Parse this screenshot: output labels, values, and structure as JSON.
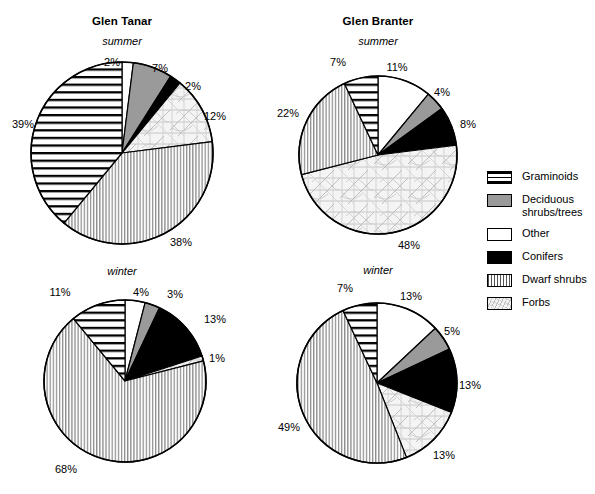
{
  "figure": {
    "panels": [
      {
        "site": "Glen Tanar",
        "season": "summer",
        "show_site_title": true,
        "cx": 122,
        "cy": 153,
        "r": 91,
        "labels": [
          {
            "text": "2%",
            "x": 112,
            "y": 62
          },
          {
            "text": "7%",
            "x": 160,
            "y": 68
          },
          {
            "text": "2%",
            "x": 193,
            "y": 86
          },
          {
            "text": "12%",
            "x": 215,
            "y": 116
          },
          {
            "text": "38%",
            "x": 181,
            "y": 242
          },
          {
            "text": "39%",
            "x": 23,
            "y": 124
          }
        ]
      },
      {
        "site": "Glen Branter",
        "season": "summer",
        "show_site_title": true,
        "cx": 378,
        "cy": 155,
        "r": 79,
        "labels": [
          {
            "text": "11%",
            "x": 397,
            "y": 67
          },
          {
            "text": "4%",
            "x": 442,
            "y": 92
          },
          {
            "text": "8%",
            "x": 468,
            "y": 124
          },
          {
            "text": "48%",
            "x": 409,
            "y": 245
          },
          {
            "text": "22%",
            "x": 288,
            "y": 113
          },
          {
            "text": "7%",
            "x": 338,
            "y": 62
          }
        ]
      },
      {
        "site": "Glen Tanar",
        "season": "winter",
        "show_site_title": false,
        "cx": 125,
        "cy": 381,
        "r": 81,
        "labels": [
          {
            "text": "4%",
            "x": 141,
            "y": 292
          },
          {
            "text": "3%",
            "x": 175,
            "y": 294
          },
          {
            "text": "13%",
            "x": 215,
            "y": 319
          },
          {
            "text": "1%",
            "x": 217,
            "y": 358
          },
          {
            "text": "68%",
            "x": 66,
            "y": 469
          },
          {
            "text": "11%",
            "x": 60,
            "y": 292
          }
        ]
      },
      {
        "site": "Glen Branter",
        "season": "winter",
        "show_site_title": false,
        "cx": 377,
        "cy": 383,
        "r": 80,
        "labels": [
          {
            "text": "13%",
            "x": 411,
            "y": 296
          },
          {
            "text": "5%",
            "x": 452,
            "y": 331
          },
          {
            "text": "13%",
            "x": 470,
            "y": 385
          },
          {
            "text": "13%",
            "x": 444,
            "y": 455
          },
          {
            "text": "49%",
            "x": 289,
            "y": 427
          },
          {
            "text": "7%",
            "x": 345,
            "y": 288
          }
        ]
      }
    ],
    "titles": [
      {
        "text": "Glen Tanar",
        "x": 122,
        "y": 22
      },
      {
        "text": "Glen Branter",
        "x": 378,
        "y": 22
      }
    ],
    "seasons": [
      {
        "text": "summer",
        "x": 122,
        "y": 42
      },
      {
        "text": "summer",
        "x": 378,
        "y": 42
      },
      {
        "text": "winter",
        "x": 122,
        "y": 272
      },
      {
        "text": "winter",
        "x": 378,
        "y": 271
      }
    ]
  },
  "legend": {
    "items": [
      {
        "label": "Graminoids",
        "pattern": "graminoids",
        "swatch_class": "sw-graminoids"
      },
      {
        "label": "Deciduous\nshrubs/trees",
        "pattern": "deciduous",
        "swatch_class": "sw-deciduous"
      },
      {
        "label": "Other",
        "pattern": "other",
        "swatch_class": "sw-other"
      },
      {
        "label": "Conifers",
        "pattern": "conifers",
        "swatch_class": "sw-conifers"
      },
      {
        "label": "Dwarf shrubs",
        "pattern": "dwarf",
        "swatch_class": "sw-dwarf"
      },
      {
        "label": "Forbs",
        "pattern": "forbs",
        "swatch_class": "sw-forbs"
      }
    ]
  },
  "chart_data": {
    "type": "pie",
    "categories": [
      "Other",
      "Deciduous shrubs/trees",
      "Conifers",
      "Forbs",
      "Dwarf shrubs",
      "Graminoids"
    ],
    "units": "percent",
    "start_angle_deg": 0,
    "direction": "clockwise",
    "series": [
      {
        "name": "Glen Tanar summer",
        "site": "Glen Tanar",
        "season": "summer",
        "values": [
          2,
          7,
          2,
          12,
          38,
          39
        ]
      },
      {
        "name": "Glen Branter summer",
        "site": "Glen Branter",
        "season": "summer",
        "values": [
          11,
          4,
          8,
          48,
          22,
          7
        ]
      },
      {
        "name": "Glen Tanar winter",
        "site": "Glen Tanar",
        "season": "winter",
        "values": [
          4,
          3,
          13,
          1,
          68,
          11
        ]
      },
      {
        "name": "Glen Branter winter",
        "site": "Glen Branter",
        "season": "winter",
        "values": [
          13,
          5,
          13,
          13,
          49,
          7
        ]
      }
    ],
    "legend_position": "right",
    "grid": false,
    "xlabel": "",
    "ylabel": ""
  },
  "style": {
    "stroke": "#000000",
    "deciduous_fill": "#9a9a9a",
    "conifers_fill": "#000000",
    "other_fill": "#ffffff",
    "forbs_fill": "#f0f0f0",
    "dwarf_fill": "#e8e8e8",
    "graminoids_fill": "#ffffff"
  }
}
